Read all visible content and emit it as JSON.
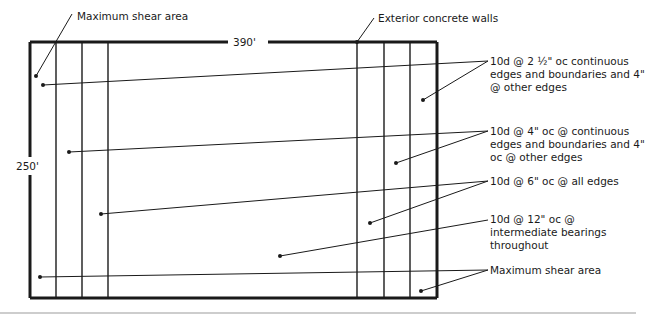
{
  "diagram": {
    "type": "diaphragm nailing plan",
    "dimensions": {
      "width_label": "390'",
      "height_label": "250'"
    },
    "callouts": {
      "max_shear_top": "Maximum shear area",
      "exterior_walls": "Exterior concrete walls",
      "nailing_1": "10d @ 2½\" oc continuous edges and boundaries and 4\" @ other edges",
      "nailing_1_line1": "10d @ 2 ½\" oc continuous",
      "nailing_1_line2": "edges and boundaries and 4\"",
      "nailing_1_line3": "@ other edges",
      "nailing_2_line1": "10d @ 4\" oc @ continuous",
      "nailing_2_line2": "edges and boundaries and 4\"",
      "nailing_2_line3": "oc @ other edges",
      "nailing_3": "10d @ 6\" oc @ all edges",
      "nailing_4_line1": "10d @ 12\" oc @",
      "nailing_4_line2": "intermediate bearings",
      "nailing_4_line3": "throughout",
      "max_shear_bottom": "Maximum shear area"
    },
    "colors": {
      "line": "#1a1a1a",
      "rule": "#bdbdbd",
      "background": "#ffffff"
    }
  }
}
